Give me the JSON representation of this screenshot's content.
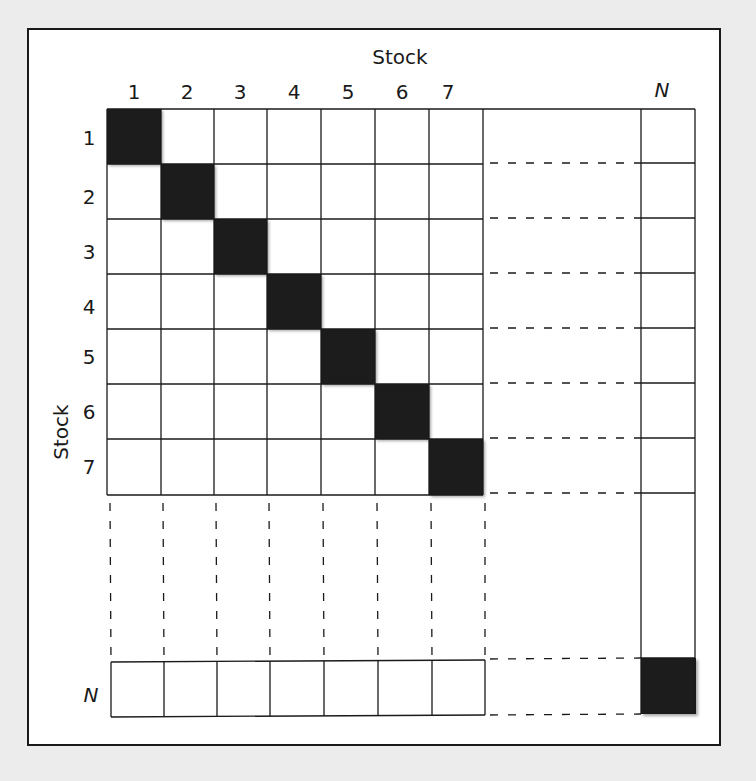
{
  "diagram": {
    "title_top": "Stock",
    "title_left": "Stock",
    "column_labels": [
      "1",
      "2",
      "3",
      "4",
      "5",
      "6",
      "7"
    ],
    "row_labels": [
      "1",
      "2",
      "3",
      "4",
      "5",
      "6",
      "7"
    ],
    "last_label": "N",
    "colors": {
      "background": "#ececec",
      "panel": "#ffffff",
      "grid_line": "#1a1a1a",
      "diagonal_fill": "#1c1c1c"
    },
    "shaded_cells": [
      {
        "row": "1",
        "col": "1"
      },
      {
        "row": "2",
        "col": "2"
      },
      {
        "row": "3",
        "col": "3"
      },
      {
        "row": "4",
        "col": "4"
      },
      {
        "row": "5",
        "col": "5"
      },
      {
        "row": "6",
        "col": "6"
      },
      {
        "row": "7",
        "col": "7"
      },
      {
        "row": "N",
        "col": "N"
      }
    ]
  }
}
